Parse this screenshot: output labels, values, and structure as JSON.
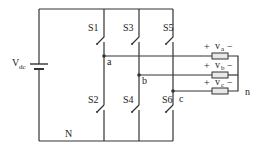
{
  "diagram": {
    "type": "three-phase voltage source inverter",
    "source": {
      "label": "V",
      "subscript": "dc"
    },
    "ground_label": "N",
    "neutral_label": "n",
    "switches": [
      {
        "label": "S1"
      },
      {
        "label": "S3"
      },
      {
        "label": "S5"
      },
      {
        "label": "S2"
      },
      {
        "label": "S4"
      },
      {
        "label": "S6"
      }
    ],
    "nodes": [
      {
        "label": "a"
      },
      {
        "label": "b"
      },
      {
        "label": "c"
      }
    ],
    "loads": [
      {
        "plus": "+",
        "label": "v",
        "subscript": "a",
        "minus": "−"
      },
      {
        "plus": "+",
        "label": "v",
        "subscript": "b",
        "minus": "−"
      },
      {
        "plus": "+",
        "label": "v",
        "subscript": "c",
        "minus": "−"
      }
    ],
    "colors": {
      "wire": "#333333",
      "resistor_fill": "#e8e8e8"
    }
  }
}
